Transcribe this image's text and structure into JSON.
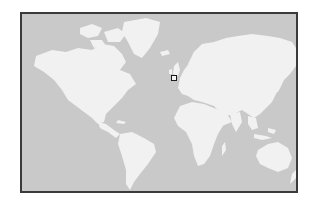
{
  "map": {
    "type": "world-map",
    "projection": "mercator",
    "colors": {
      "ocean": "#c9c9c9",
      "land": "#f1f1f1",
      "border": "#3a3a3a",
      "marker": "#1a1a1a"
    },
    "marker": {
      "label": "",
      "region": "Western Europe",
      "x": 170,
      "y": 74
    }
  }
}
